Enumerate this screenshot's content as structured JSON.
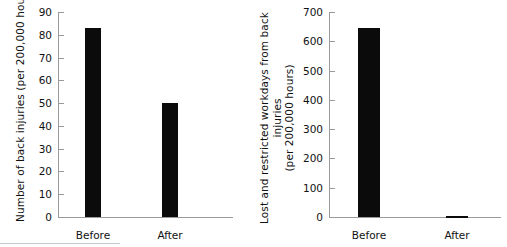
{
  "figure": {
    "background": "#ffffff",
    "bar_color": "#0b0b0b",
    "axis_color": "#9a9a9a",
    "text_color": "#111111"
  },
  "chart_data": [
    {
      "type": "bar",
      "title": "",
      "xlabel": "",
      "ylabel": "Number of back injuries (per 200,000 hours)",
      "ylabel_lines": [
        "Number of back injuries (per 200,000 hours)"
      ],
      "categories": [
        "Before",
        "After"
      ],
      "values": [
        83,
        50
      ],
      "ylim": [
        0,
        90
      ],
      "yticks": [
        0,
        10,
        20,
        30,
        40,
        50,
        60,
        70,
        80,
        90
      ],
      "ytick_labels": [
        "0",
        "10",
        "20",
        "30",
        "40",
        "50",
        "60",
        "70",
        "80",
        "90"
      ],
      "grid": false,
      "legend": "none"
    },
    {
      "type": "bar",
      "title": "",
      "xlabel": "",
      "ylabel": "Lost and restricted workdays from back injuries (per 200,000 hours)",
      "ylabel_lines": [
        "Lost and restricted workdays from back injuries",
        "(per 200,000 hours)"
      ],
      "categories": [
        "Before",
        "After"
      ],
      "values": [
        645,
        5
      ],
      "ylim": [
        0,
        700
      ],
      "yticks": [
        0,
        100,
        200,
        300,
        400,
        500,
        600,
        700
      ],
      "ytick_labels": [
        "0",
        "100",
        "200",
        "300",
        "400",
        "500",
        "600",
        "700"
      ],
      "grid": false,
      "legend": "none"
    }
  ],
  "panels": [
    {
      "id": "left",
      "ylabel_line1": "Number of back injuries (per 200,000 hours)",
      "ylabel_line2": "",
      "yticks": [
        {
          "label": "90",
          "value": 90
        },
        {
          "label": "80",
          "value": 80
        },
        {
          "label": "70",
          "value": 70
        },
        {
          "label": "60",
          "value": 60
        },
        {
          "label": "50",
          "value": 50
        },
        {
          "label": "40",
          "value": 40
        },
        {
          "label": "30",
          "value": 30
        },
        {
          "label": "20",
          "value": 20
        },
        {
          "label": "10",
          "value": 10
        },
        {
          "label": "0",
          "value": 0
        }
      ],
      "bars": [
        {
          "label": "Before",
          "value": 83
        },
        {
          "label": "After",
          "value": 50
        }
      ]
    },
    {
      "id": "right",
      "ylabel_line1": "Lost and restricted workdays from back injuries",
      "ylabel_line2": "(per 200,000 hours)",
      "yticks": [
        {
          "label": "700",
          "value": 700
        },
        {
          "label": "600",
          "value": 600
        },
        {
          "label": "500",
          "value": 500
        },
        {
          "label": "400",
          "value": 400
        },
        {
          "label": "300",
          "value": 300
        },
        {
          "label": "200",
          "value": 200
        },
        {
          "label": "100",
          "value": 100
        },
        {
          "label": "0",
          "value": 0
        }
      ],
      "bars": [
        {
          "label": "Before",
          "value": 645
        },
        {
          "label": "After",
          "value": 5
        }
      ]
    }
  ]
}
